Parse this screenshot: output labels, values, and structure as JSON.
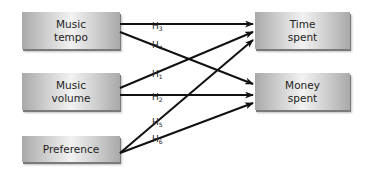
{
  "diagram": {
    "sources": [
      {
        "id": "tempo",
        "label": "Music\ntempo"
      },
      {
        "id": "volume",
        "label": "Music\nvolume"
      },
      {
        "id": "preference",
        "label": "Preference"
      }
    ],
    "targets": [
      {
        "id": "time",
        "label": "Time\nspent"
      },
      {
        "id": "money",
        "label": "Money\nspent"
      }
    ],
    "hypotheses": [
      {
        "name": "H",
        "sub": "3",
        "from": "tempo",
        "to": "time"
      },
      {
        "name": "H",
        "sub": "4",
        "from": "tempo",
        "to": "money"
      },
      {
        "name": "H",
        "sub": "1",
        "from": "volume",
        "to": "time"
      },
      {
        "name": "H",
        "sub": "2",
        "from": "volume",
        "to": "money"
      },
      {
        "name": "H",
        "sub": "5",
        "from": "preference",
        "to": "time"
      },
      {
        "name": "H",
        "sub": "6",
        "from": "preference",
        "to": "money"
      }
    ]
  }
}
